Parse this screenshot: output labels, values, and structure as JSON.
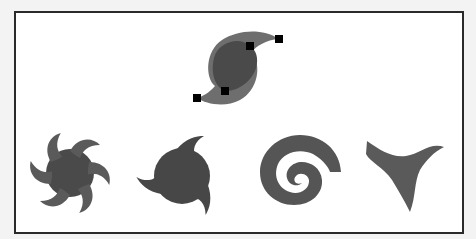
{
  "figure": {
    "frame_color": "#2a2a2a",
    "background_color": "#ffffff",
    "outer_background": "#f3f3f3",
    "shape_fill_dark": "#4a4a4a",
    "shape_fill_light": "#6e6e6e",
    "anchor_color": "#000000"
  },
  "selected_shape": {
    "name": "s-swirl-with-anchor-points",
    "anchors": [
      {
        "x": 279,
        "y": 39
      },
      {
        "x": 250,
        "y": 46
      },
      {
        "x": 225,
        "y": 91
      },
      {
        "x": 197,
        "y": 98
      }
    ]
  },
  "shapes": [
    {
      "name": "pinwheel-six-blades"
    },
    {
      "name": "three-hook-blob"
    },
    {
      "name": "spiral"
    },
    {
      "name": "three-prong-curve"
    }
  ]
}
